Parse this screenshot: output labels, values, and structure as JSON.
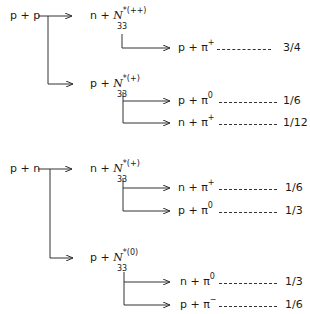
{
  "groups": [
    {
      "reaction": "p + p",
      "branches": [
        {
          "state": {
            "prefix": "n + ",
            "symbol": "N",
            "sup": "*(++)",
            "sub": "33"
          },
          "decays": [
            {
              "products": "p + π",
              "charge": "+",
              "fraction": "3/4"
            }
          ]
        },
        {
          "state": {
            "prefix": "p + ",
            "symbol": "N",
            "sup": "*(+)",
            "sub": "33"
          },
          "decays": [
            {
              "products": "p + π",
              "charge": "0",
              "fraction": "1/6"
            },
            {
              "products": "n + π",
              "charge": "+",
              "fraction": "1/12"
            }
          ]
        }
      ]
    },
    {
      "reaction": "p + n",
      "branches": [
        {
          "state": {
            "prefix": "n + ",
            "symbol": "N",
            "sup": "*(+)",
            "sub": "33"
          },
          "decays": [
            {
              "products": "n + π",
              "charge": "+",
              "fraction": "1/6"
            },
            {
              "products": "p + π",
              "charge": "0",
              "fraction": "1/3"
            }
          ]
        },
        {
          "state": {
            "prefix": "p + ",
            "symbol": "N",
            "sup": "*(0)",
            "sub": "33"
          },
          "decays": [
            {
              "products": "n + π",
              "charge": "0",
              "fraction": "1/3"
            },
            {
              "products": "p + π",
              "charge": "−",
              "fraction": "1/6"
            }
          ]
        }
      ]
    }
  ]
}
